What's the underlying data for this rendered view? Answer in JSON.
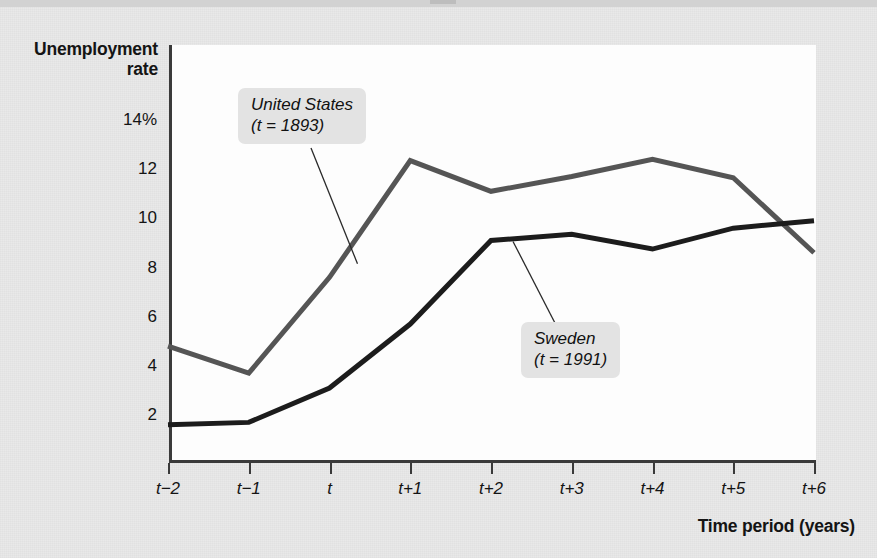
{
  "figure": {
    "background_color": "#e4e4e4",
    "plot_background_color": "#fdfdfd",
    "axis_color": "#3a3a3a"
  },
  "chart_data": {
    "type": "line",
    "title": "",
    "xlabel": "Time period (years)",
    "ylabel": "Unemployment rate",
    "ylabel_line1": "Unemployment",
    "ylabel_line2": "rate",
    "grid": false,
    "legend_position": "inline-callouts",
    "categories": [
      "t-2",
      "t-1",
      "t",
      "t+1",
      "t+2",
      "t+3",
      "t+4",
      "t+5",
      "t+6"
    ],
    "x_tick_labels": [
      "t−2",
      "t−1",
      "t",
      "t+1",
      "t+2",
      "t+3",
      "t+4",
      "t+5",
      "t+6"
    ],
    "y_tick_labels": [
      "14%",
      "12",
      "10",
      "8",
      "6",
      "4",
      "2"
    ],
    "y_tick_values": [
      14,
      12,
      10,
      8,
      6,
      4,
      2
    ],
    "ylim": [
      0.6,
      15.2
    ],
    "xlim": [
      -2,
      6
    ],
    "series": [
      {
        "name": "United States",
        "annotation": "(t = 1893)",
        "color": "#555555",
        "line_width": 5,
        "values": [
          4.8,
          3.7,
          7.6,
          12.35,
          11.1,
          11.7,
          12.4,
          11.65,
          8.6
        ]
      },
      {
        "name": "Sweden",
        "annotation": "(t = 1991)",
        "color": "#1c1c1c",
        "line_width": 5,
        "values": [
          1.6,
          1.7,
          3.1,
          5.7,
          9.1,
          9.35,
          8.75,
          9.6,
          9.9
        ]
      }
    ],
    "annotations": [
      {
        "id": "united-states",
        "line1": "United States",
        "line2": "(t = 1893)",
        "points_to_series": "United States",
        "points_to_x": "t"
      },
      {
        "id": "sweden",
        "line1": "Sweden",
        "line2": "(t = 1991)",
        "points_to_series": "Sweden",
        "points_to_x": "t+2"
      }
    ]
  }
}
